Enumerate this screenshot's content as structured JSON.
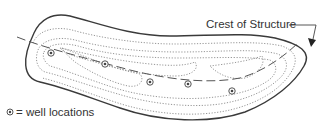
{
  "diagram": {
    "crest_label": "Crest of Structure",
    "legend": {
      "symbol": "well-symbol",
      "text": "= well locations"
    },
    "wells": [
      {
        "id": 1,
        "x": 51,
        "y": 53
      },
      {
        "id": 2,
        "x": 105,
        "y": 64
      },
      {
        "id": 3,
        "x": 150,
        "y": 82
      },
      {
        "id": 4,
        "x": 188,
        "y": 84
      },
      {
        "id": 5,
        "x": 232,
        "y": 91
      }
    ],
    "colors": {
      "outline": "#3a3a3a",
      "contour": "#8a8a8a",
      "crest_line": "#555555",
      "text": "#333333",
      "background": "#ffffff"
    }
  }
}
